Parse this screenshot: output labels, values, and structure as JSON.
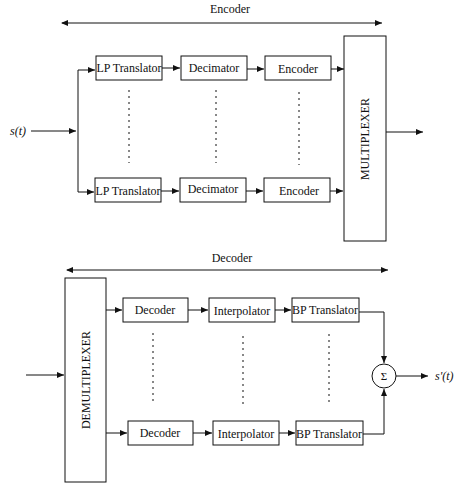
{
  "encoder": {
    "section_label": "Encoder",
    "input_label": "s(t)",
    "mux_label": "MULTIPLEXER",
    "rows": [
      {
        "blocks": [
          "LP Translator",
          "Decimator",
          "Encoder"
        ]
      },
      {
        "blocks": [
          "LP Translator",
          "Decimator",
          "Encoder"
        ]
      }
    ]
  },
  "decoder": {
    "section_label": "Decoder",
    "demux_label": "DEMULTIPLEXER",
    "sum_symbol": "Σ",
    "output_label": "s'(t)",
    "rows": [
      {
        "blocks": [
          "Decoder",
          "Interpolator",
          "BP Translator"
        ]
      },
      {
        "blocks": [
          "Decoder",
          "Interpolator",
          "BP Translator"
        ]
      }
    ]
  }
}
